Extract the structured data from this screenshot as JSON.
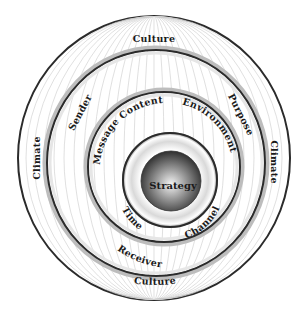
{
  "diagram": {
    "type": "concentric-circles",
    "center_label": "Strategy",
    "rings": [
      {
        "level": 1,
        "name": "outer",
        "labels": {
          "top": "Culture",
          "bottom": "Culture",
          "left": "Climate",
          "right": "Climate"
        }
      },
      {
        "level": 2,
        "name": "participants-purpose",
        "labels": {
          "upper_left": "Sender",
          "upper_right": "Purpose",
          "lower_left": "Receiver"
        }
      },
      {
        "level": 3,
        "name": "content-environment",
        "labels": {
          "upper_left": "Message Content",
          "upper_right": "Environment"
        }
      },
      {
        "level": 4,
        "name": "time-channel",
        "labels": {
          "lower_left": "Time",
          "lower_right": "Channel"
        }
      }
    ],
    "colors": {
      "ring_stroke": "#2b2b2b",
      "meridian": "#cfcfcf",
      "sphere_dark": "#3a3a3a",
      "sphere_light": "#f2f2f2",
      "text": "#1a1a1a"
    }
  }
}
